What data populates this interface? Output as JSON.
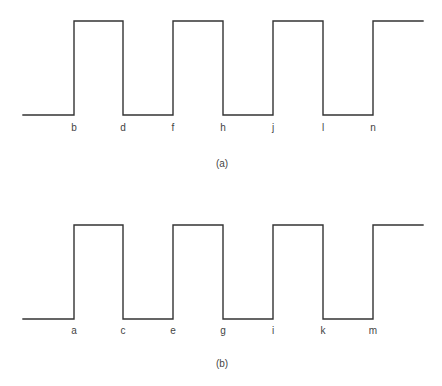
{
  "figure": {
    "colors": {
      "line": "#333333",
      "text": "#444444",
      "background": "#ffffff"
    },
    "panels": [
      {
        "id": "a",
        "caption": "(a)",
        "caption_pos": {
          "x": 222,
          "y": 167
        },
        "levels": {
          "low_y": 115,
          "high_y": 21
        },
        "start_x": 23,
        "end_x": 423,
        "initial_level": "low",
        "edges": [
          {
            "x": 74,
            "type": "rising",
            "label": "b"
          },
          {
            "x": 123,
            "type": "falling",
            "label": "d"
          },
          {
            "x": 173,
            "type": "rising",
            "label": "f"
          },
          {
            "x": 223,
            "type": "falling",
            "label": "h"
          },
          {
            "x": 273,
            "type": "rising",
            "label": "j"
          },
          {
            "x": 323,
            "type": "falling",
            "label": "l"
          },
          {
            "x": 373,
            "type": "rising",
            "label": "n"
          }
        ],
        "label_y": 131
      },
      {
        "id": "b",
        "caption": "(b)",
        "caption_pos": {
          "x": 222,
          "y": 367
        },
        "levels": {
          "low_y": 319,
          "high_y": 225
        },
        "start_x": 23,
        "end_x": 423,
        "initial_level": "low",
        "edges": [
          {
            "x": 74,
            "type": "rising",
            "label": "a"
          },
          {
            "x": 123,
            "type": "falling",
            "label": "c"
          },
          {
            "x": 173,
            "type": "rising",
            "label": "e"
          },
          {
            "x": 223,
            "type": "falling",
            "label": "g"
          },
          {
            "x": 273,
            "type": "rising",
            "label": "i"
          },
          {
            "x": 323,
            "type": "falling",
            "label": "k"
          },
          {
            "x": 373,
            "type": "rising",
            "label": "m"
          }
        ],
        "label_y": 334
      }
    ]
  }
}
